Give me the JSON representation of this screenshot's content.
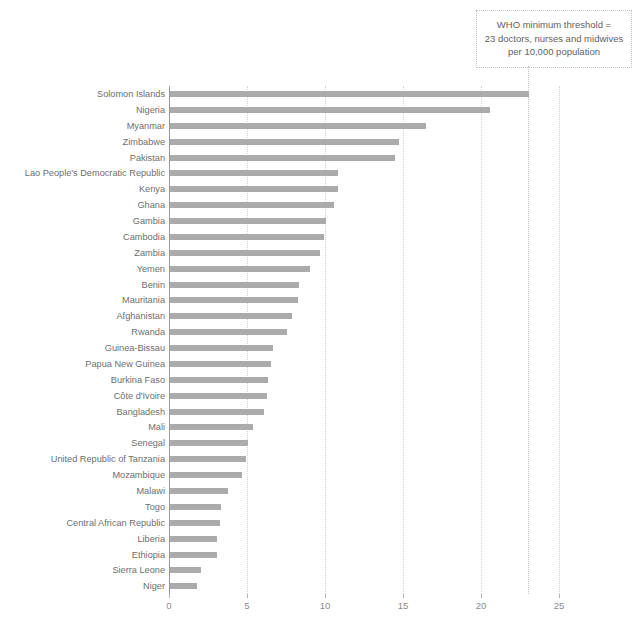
{
  "annotation": {
    "name": "who-threshold-callout",
    "line1": "WHO minimum threshold =",
    "line2": "23 doctors, nurses and midwives",
    "line3": "per 10,000 population",
    "threshold_value": 23
  },
  "colors": {
    "bar": "#ababab",
    "axis": "#9a9a9a",
    "grid": "#d2d2d2",
    "label_text": "#6e6e6e",
    "tick_text": "#8a8a8a",
    "callout_border": "#c0c0c0",
    "background": "#ffffff"
  },
  "chart_data": {
    "type": "bar",
    "orientation": "horizontal",
    "title": "",
    "subtitle": "",
    "xlabel": "",
    "ylabel": "",
    "xlim": [
      0,
      26.5
    ],
    "xticks": [
      0,
      5,
      10,
      15,
      20,
      25
    ],
    "xtick_labels": [
      "0",
      "5",
      "10",
      "15",
      "20",
      "25"
    ],
    "grid": "vertical-dotted",
    "legend": "none",
    "annotations": [
      {
        "text": "WHO minimum threshold = 23 doctors, nurses and midwives per 10,000 population",
        "type": "vertical-threshold-line",
        "x": 23
      }
    ],
    "categories": [
      "Solomon Islands",
      "Nigeria",
      "Myanmar",
      "Zimbabwe",
      "Pakistan",
      "Lao People's Democratic Republic",
      "Kenya",
      "Ghana",
      "Gambia",
      "Cambodia",
      "Zambia",
      "Yemen",
      "Benin",
      "Mauritania",
      "Afghanistan",
      "Rwanda",
      "Guinea-Bissau",
      "Papua New Guinea",
      "Burkina Faso",
      "Côte d'Ivoire",
      "Bangladesh",
      "Mali",
      "Senegal",
      "United Republic of Tanzania",
      "Mozambique",
      "Malawi",
      "Togo",
      "Central African Republic",
      "Liberia",
      "Ethiopia",
      "Sierra Leone",
      "Niger"
    ],
    "values": [
      23.0,
      20.5,
      16.4,
      14.7,
      14.4,
      10.8,
      10.8,
      10.5,
      10.0,
      9.9,
      9.6,
      9.0,
      8.3,
      8.2,
      7.8,
      7.5,
      6.6,
      6.5,
      6.3,
      6.2,
      6.0,
      5.3,
      5.0,
      4.9,
      4.6,
      3.7,
      3.3,
      3.2,
      3.0,
      3.0,
      2.0,
      1.7
    ]
  }
}
